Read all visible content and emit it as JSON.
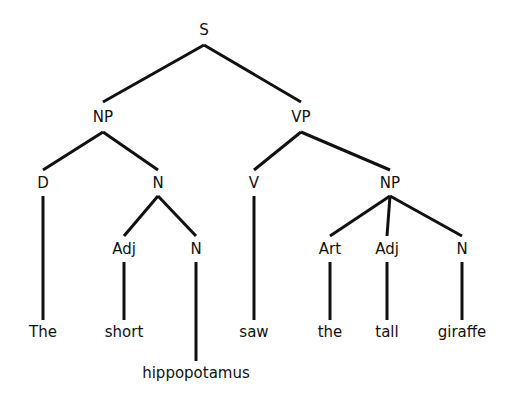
{
  "diagram": {
    "type": "syntax-tree",
    "sentence": "The short hippopotamus saw the tall giraffe",
    "nodes": [
      {
        "id": "S",
        "label": "S",
        "x": 204,
        "y": 30,
        "top": 16,
        "bottom": 45
      },
      {
        "id": "NP1",
        "label": "NP",
        "x": 103,
        "y": 117,
        "top": 102,
        "bottom": 132
      },
      {
        "id": "VP",
        "label": "VP",
        "x": 301,
        "y": 117,
        "top": 102,
        "bottom": 132
      },
      {
        "id": "D",
        "label": "D",
        "x": 43,
        "y": 183,
        "top": 170,
        "bottom": 196
      },
      {
        "id": "N1",
        "label": "N",
        "x": 158,
        "y": 183,
        "top": 170,
        "bottom": 196
      },
      {
        "id": "V",
        "label": "V",
        "x": 254,
        "y": 183,
        "top": 170,
        "bottom": 196
      },
      {
        "id": "NP2",
        "label": "NP",
        "x": 390,
        "y": 183,
        "top": 170,
        "bottom": 196
      },
      {
        "id": "Adj1",
        "label": "Adj",
        "x": 124,
        "y": 249,
        "top": 236,
        "bottom": 262
      },
      {
        "id": "N2",
        "label": "N",
        "x": 196,
        "y": 249,
        "top": 236,
        "bottom": 262
      },
      {
        "id": "Art",
        "label": "Art",
        "x": 330,
        "y": 249,
        "top": 236,
        "bottom": 262
      },
      {
        "id": "Adj2",
        "label": "Adj",
        "x": 387,
        "y": 249,
        "top": 236,
        "bottom": 262
      },
      {
        "id": "N3",
        "label": "N",
        "x": 462,
        "y": 249,
        "top": 236,
        "bottom": 262
      },
      {
        "id": "w1",
        "label": "The",
        "x": 43,
        "y": 332,
        "top": 320,
        "bottom": 344
      },
      {
        "id": "w2",
        "label": "short",
        "x": 124,
        "y": 332,
        "top": 320,
        "bottom": 344
      },
      {
        "id": "w3",
        "label": "hippopotamus",
        "x": 196,
        "y": 373,
        "top": 361,
        "bottom": 385
      },
      {
        "id": "w4",
        "label": "saw",
        "x": 254,
        "y": 332,
        "top": 320,
        "bottom": 344
      },
      {
        "id": "w5",
        "label": "the",
        "x": 330,
        "y": 332,
        "top": 320,
        "bottom": 344
      },
      {
        "id": "w6",
        "label": "tall",
        "x": 387,
        "y": 332,
        "top": 320,
        "bottom": 344
      },
      {
        "id": "w7",
        "label": "giraffe",
        "x": 462,
        "y": 332,
        "top": 320,
        "bottom": 344
      }
    ],
    "edges": [
      [
        "S",
        "NP1"
      ],
      [
        "S",
        "VP"
      ],
      [
        "NP1",
        "D"
      ],
      [
        "NP1",
        "N1"
      ],
      [
        "VP",
        "V"
      ],
      [
        "VP",
        "NP2"
      ],
      [
        "N1",
        "Adj1"
      ],
      [
        "N1",
        "N2"
      ],
      [
        "NP2",
        "Art"
      ],
      [
        "NP2",
        "Adj2"
      ],
      [
        "NP2",
        "N3"
      ],
      [
        "D",
        "w1"
      ],
      [
        "Adj1",
        "w2"
      ],
      [
        "N2",
        "w3"
      ],
      [
        "V",
        "w4"
      ],
      [
        "Art",
        "w5"
      ],
      [
        "Adj2",
        "w6"
      ],
      [
        "N3",
        "w7"
      ]
    ],
    "colors": {
      "line": "#111111",
      "text": "#111111",
      "background": "#ffffff"
    }
  }
}
